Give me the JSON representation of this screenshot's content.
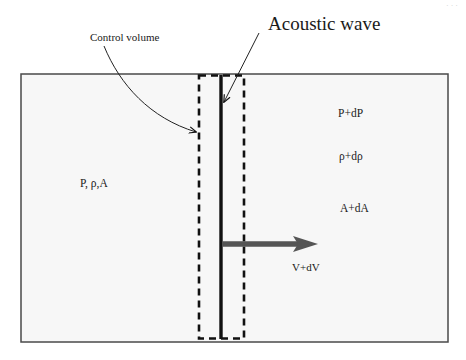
{
  "diagram": {
    "colors": {
      "background": "#ffffff",
      "domain_fill": "#f7f7f7",
      "domain_border": "#4a4a4a",
      "line": "#111111",
      "velocity_arrow": "#555555"
    },
    "labels": {
      "control_volume": "Control volume",
      "acoustic_wave": "Acoustic wave",
      "upstream_state": "P, ρ,A",
      "downstream_pressure": "P+dP",
      "downstream_density": "ρ+dρ",
      "downstream_area": "A+dA",
      "downstream_velocity": "V+dV"
    },
    "elements": {
      "domain_rect": {
        "x": 21,
        "y": 74,
        "width": 427,
        "height": 268
      },
      "control_volume_box": {
        "x": 199,
        "y": 75,
        "width": 45,
        "height": 264,
        "style": "dashed"
      },
      "wave_front": {
        "x": 221,
        "y1": 75,
        "y2": 339
      },
      "velocity_arrow": {
        "x1": 222,
        "x2": 318,
        "y": 244
      }
    }
  }
}
